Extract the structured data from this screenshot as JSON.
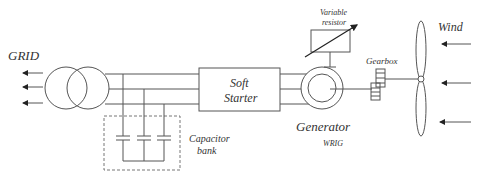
{
  "diagram": {
    "labels": {
      "grid": "GRID",
      "soft_starter_line1": "Soft",
      "soft_starter_line2": "Starter",
      "capacitor_line1": "Capacitor",
      "capacitor_line2": "bank",
      "variable_resistor_line1": "Variable",
      "variable_resistor_line2": "resistor",
      "gearbox": "Gearbox",
      "generator": "Generator",
      "generator_type": "WRIG",
      "wind": "Wind"
    },
    "components": [
      {
        "id": "grid",
        "label": "GRID",
        "type": "grid-connection",
        "arrows": 3
      },
      {
        "id": "transformer",
        "type": "two-winding-transformer"
      },
      {
        "id": "capacitor-bank",
        "label": "Capacitor bank",
        "type": "capacitor-array",
        "count": 3
      },
      {
        "id": "soft-starter",
        "label": "Soft Starter",
        "type": "box"
      },
      {
        "id": "generator",
        "label": "Generator",
        "sublabel": "WRIG",
        "type": "induction-generator"
      },
      {
        "id": "variable-resistor",
        "label": "Variable resistor",
        "type": "rheostat"
      },
      {
        "id": "gearbox",
        "label": "Gearbox",
        "type": "gearbox"
      },
      {
        "id": "rotor",
        "type": "turbine-blades",
        "blades": 2
      },
      {
        "id": "wind",
        "label": "Wind",
        "type": "arrows",
        "arrows": 3
      }
    ],
    "connections": [
      [
        "transformer",
        "grid"
      ],
      [
        "transformer",
        "capacitor-bank"
      ],
      [
        "transformer",
        "soft-starter"
      ],
      [
        "soft-starter",
        "generator"
      ],
      [
        "generator",
        "variable-resistor"
      ],
      [
        "generator",
        "gearbox"
      ],
      [
        "gearbox",
        "rotor"
      ],
      [
        "wind",
        "rotor"
      ]
    ],
    "colors": {
      "line": "#555555",
      "text": "#333333",
      "background": "#ffffff"
    }
  }
}
